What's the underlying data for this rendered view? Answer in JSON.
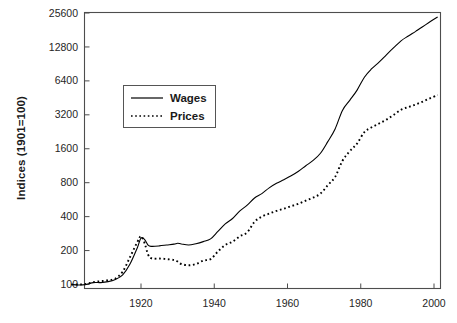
{
  "chart_data": {
    "type": "line",
    "title": "",
    "xlabel": "",
    "ylabel": "Indices (1901=100)",
    "grid": false,
    "yscale": "log2",
    "ylim": [
      85,
      25600
    ],
    "xlim": [
      1901,
      2002
    ],
    "ytick_labels": [
      "25600",
      "12800",
      "6400",
      "3200",
      "1600",
      "800",
      "400",
      "200",
      "100"
    ],
    "ytick_values": [
      25600,
      12800,
      6400,
      3200,
      1600,
      800,
      400,
      200,
      100
    ],
    "xtick_labels": [
      "1920",
      "1940",
      "1960",
      "1980",
      "2000"
    ],
    "xtick_values": [
      1920,
      1940,
      1960,
      1980,
      2000
    ],
    "legend": {
      "position": "upper-left-inside",
      "entries": [
        {
          "label": "Wages",
          "style": "solid"
        },
        {
          "label": "Prices",
          "style": "dotted"
        }
      ]
    },
    "series": [
      {
        "name": "Wages",
        "style": "solid",
        "x": [
          1901,
          1903,
          1905,
          1907,
          1909,
          1911,
          1913,
          1915,
          1917,
          1919,
          1920,
          1921,
          1922,
          1923,
          1925,
          1927,
          1929,
          1930,
          1931,
          1933,
          1935,
          1937,
          1939,
          1941,
          1943,
          1945,
          1947,
          1949,
          1951,
          1953,
          1955,
          1957,
          1959,
          1961,
          1963,
          1965,
          1967,
          1969,
          1971,
          1973,
          1975,
          1977,
          1979,
          1981,
          1983,
          1985,
          1987,
          1989,
          1991,
          1993,
          1995,
          1997,
          1999,
          2001
        ],
        "y": [
          100,
          99,
          100,
          104,
          104,
          106,
          111,
          122,
          152,
          212,
          258,
          250,
          222,
          218,
          220,
          224,
          228,
          232,
          229,
          224,
          230,
          240,
          254,
          296,
          345,
          385,
          450,
          505,
          585,
          640,
          720,
          790,
          850,
          920,
          1010,
          1130,
          1260,
          1460,
          1850,
          2400,
          3500,
          4300,
          5300,
          6900,
          8200,
          9400,
          10900,
          12600,
          14500,
          16000,
          17600,
          19400,
          21500,
          23600
        ]
      },
      {
        "name": "Prices",
        "style": "dotted",
        "x": [
          1901,
          1903,
          1905,
          1907,
          1909,
          1911,
          1913,
          1915,
          1917,
          1919,
          1920,
          1921,
          1922,
          1923,
          1925,
          1927,
          1929,
          1930,
          1931,
          1933,
          1935,
          1937,
          1939,
          1941,
          1943,
          1945,
          1947,
          1949,
          1951,
          1953,
          1955,
          1957,
          1959,
          1961,
          1963,
          1965,
          1967,
          1969,
          1971,
          1973,
          1975,
          1977,
          1979,
          1981,
          1983,
          1985,
          1987,
          1989,
          1991,
          1993,
          1995,
          1997,
          1999,
          2001
        ],
        "y": [
          100,
          100,
          101,
          105,
          107,
          109,
          113,
          130,
          175,
          238,
          268,
          232,
          182,
          170,
          170,
          168,
          165,
          160,
          152,
          148,
          152,
          163,
          168,
          196,
          224,
          240,
          268,
          290,
          360,
          400,
          425,
          450,
          470,
          495,
          520,
          555,
          590,
          640,
          760,
          900,
          1250,
          1520,
          1780,
          2250,
          2480,
          2680,
          2900,
          3200,
          3550,
          3750,
          3950,
          4200,
          4500,
          4800
        ]
      }
    ]
  }
}
